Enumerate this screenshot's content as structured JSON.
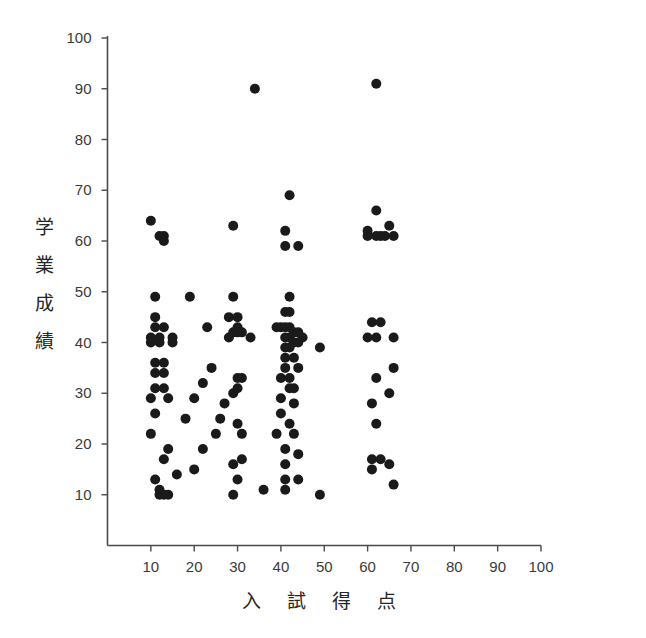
{
  "chart_data": {
    "type": "scatter",
    "title": "",
    "xlabel": "入 試 得 点",
    "ylabel": "学業成績",
    "ylabel_chars": [
      "学",
      "業",
      "成",
      "績"
    ],
    "xlim": [
      0,
      100
    ],
    "ylim": [
      0,
      100
    ],
    "xticks": [
      10,
      20,
      30,
      40,
      50,
      60,
      70,
      80,
      90,
      100
    ],
    "yticks": [
      10,
      20,
      30,
      40,
      50,
      60,
      70,
      80,
      90,
      100
    ],
    "xtick_labels": [
      "10",
      "20",
      "30",
      "40",
      "50",
      "60",
      "70",
      "80",
      "90",
      "100"
    ],
    "ytick_labels": [
      "10",
      "20",
      "30",
      "40",
      "50",
      "60",
      "70",
      "80",
      "90",
      "100"
    ],
    "grid": false,
    "legend": null,
    "marker": "filled-circle",
    "marker_color": "#1a1a1a",
    "marker_size": 5,
    "n_points": 122,
    "points": [
      [
        34,
        90
      ],
      [
        62,
        91
      ],
      [
        42,
        69
      ],
      [
        62,
        66
      ],
      [
        10,
        64
      ],
      [
        29,
        63
      ],
      [
        41,
        62
      ],
      [
        60,
        62
      ],
      [
        65,
        63
      ],
      [
        12,
        61
      ],
      [
        13,
        61
      ],
      [
        13,
        60
      ],
      [
        41,
        59
      ],
      [
        44,
        59
      ],
      [
        60,
        61
      ],
      [
        62,
        61
      ],
      [
        63,
        61
      ],
      [
        64,
        61
      ],
      [
        66,
        61
      ],
      [
        11,
        49
      ],
      [
        19,
        49
      ],
      [
        29,
        49
      ],
      [
        42,
        49
      ],
      [
        11,
        45
      ],
      [
        28,
        45
      ],
      [
        30,
        45
      ],
      [
        41,
        46
      ],
      [
        42,
        46
      ],
      [
        11,
        43
      ],
      [
        13,
        43
      ],
      [
        23,
        43
      ],
      [
        30,
        43
      ],
      [
        61,
        44
      ],
      [
        63,
        44
      ],
      [
        10,
        41
      ],
      [
        12,
        41
      ],
      [
        15,
        41
      ],
      [
        29,
        42
      ],
      [
        30,
        42
      ],
      [
        31,
        42
      ],
      [
        33,
        41
      ],
      [
        39,
        43
      ],
      [
        40,
        43
      ],
      [
        41,
        43
      ],
      [
        42,
        43
      ],
      [
        43,
        42
      ],
      [
        44,
        42
      ],
      [
        45,
        41
      ],
      [
        60,
        41
      ],
      [
        62,
        41
      ],
      [
        66,
        41
      ],
      [
        10,
        40
      ],
      [
        12,
        40
      ],
      [
        15,
        40
      ],
      [
        28,
        41
      ],
      [
        41,
        41
      ],
      [
        42,
        41
      ],
      [
        43,
        40
      ],
      [
        44,
        40
      ],
      [
        11,
        36
      ],
      [
        13,
        36
      ],
      [
        41,
        39
      ],
      [
        42,
        39
      ],
      [
        49,
        39
      ],
      [
        11,
        34
      ],
      [
        13,
        34
      ],
      [
        24,
        35
      ],
      [
        41,
        37
      ],
      [
        43,
        37
      ],
      [
        66,
        35
      ],
      [
        11,
        31
      ],
      [
        13,
        31
      ],
      [
        22,
        32
      ],
      [
        30,
        33
      ],
      [
        31,
        33
      ],
      [
        41,
        35
      ],
      [
        44,
        35
      ],
      [
        62,
        33
      ],
      [
        10,
        29
      ],
      [
        14,
        29
      ],
      [
        30,
        31
      ],
      [
        40,
        33
      ],
      [
        42,
        33
      ],
      [
        65,
        30
      ],
      [
        20,
        29
      ],
      [
        29,
        30
      ],
      [
        42,
        31
      ],
      [
        43,
        31
      ],
      [
        11,
        26
      ],
      [
        27,
        28
      ],
      [
        40,
        29
      ],
      [
        43,
        28
      ],
      [
        61,
        28
      ],
      [
        10,
        22
      ],
      [
        18,
        25
      ],
      [
        26,
        25
      ],
      [
        30,
        24
      ],
      [
        40,
        26
      ],
      [
        42,
        24
      ],
      [
        62,
        24
      ],
      [
        25,
        22
      ],
      [
        31,
        22
      ],
      [
        39,
        22
      ],
      [
        43,
        22
      ],
      [
        14,
        19
      ],
      [
        22,
        19
      ],
      [
        31,
        17
      ],
      [
        41,
        19
      ],
      [
        44,
        18
      ],
      [
        13,
        17
      ],
      [
        20,
        15
      ],
      [
        29,
        16
      ],
      [
        41,
        16
      ],
      [
        61,
        17
      ],
      [
        63,
        17
      ],
      [
        65,
        16
      ],
      [
        11,
        13
      ],
      [
        16,
        14
      ],
      [
        30,
        13
      ],
      [
        41,
        13
      ],
      [
        44,
        13
      ],
      [
        61,
        15
      ],
      [
        66,
        12
      ],
      [
        12,
        11
      ],
      [
        12,
        10
      ],
      [
        13,
        10
      ],
      [
        14,
        10
      ],
      [
        29,
        10
      ],
      [
        36,
        11
      ],
      [
        41,
        11
      ],
      [
        49,
        10
      ]
    ]
  },
  "axes": {
    "axis_color": "#4a4a4a",
    "background": "#ffffff"
  }
}
